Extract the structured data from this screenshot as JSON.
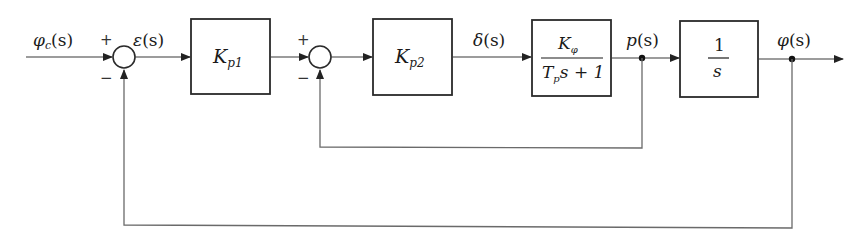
{
  "diagram": {
    "type": "block-diagram",
    "title": "",
    "signals": {
      "input": {
        "main": "φ",
        "sub": "c",
        "arg": "(s)"
      },
      "error": {
        "main": "ε",
        "arg": "(s)"
      },
      "delta": {
        "main": "δ",
        "arg": "(s)"
      },
      "roll_rate": {
        "main": "p",
        "arg": "(s)"
      },
      "output": {
        "main": "φ",
        "arg": "(s)"
      }
    },
    "summing_junctions": [
      {
        "id": "sum1",
        "plus": "+",
        "minus": "−"
      },
      {
        "id": "sum2",
        "plus": "+",
        "minus": "−"
      }
    ],
    "blocks": [
      {
        "id": "kp1",
        "main": "K",
        "sub": "p1"
      },
      {
        "id": "kp2",
        "main": "K",
        "sub": "p2"
      },
      {
        "id": "plant",
        "num_main": "K",
        "num_sub": "φ",
        "den_a": "T",
        "den_sub": "p",
        "den_b": "s + 1"
      },
      {
        "id": "integrator",
        "num": "1",
        "den": "s"
      }
    ],
    "edges": [
      "φc(s) → sum1 (+)",
      "sum1 → ε(s) → Kp1",
      "Kp1 → sum2 (+)",
      "sum2 → Kp2",
      "Kp2 → δ(s) → Kφ/(Tp s+1)",
      "Kφ/(Tp s+1) → p(s) → 1/s",
      "1/s → φ(s)",
      "p(s) → sum2 (−) [inner feedback]",
      "φ(s) → sum1 (−) [outer feedback]"
    ]
  }
}
